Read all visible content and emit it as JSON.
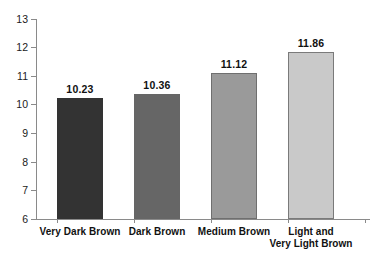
{
  "chart_data": {
    "type": "bar",
    "title": "",
    "xlabel": "",
    "ylabel": "",
    "ylim": [
      6,
      13
    ],
    "ytick_labels": [
      "13",
      "12",
      "11",
      "10",
      "9",
      "8",
      "7",
      "6"
    ],
    "yticks": [
      13,
      12,
      11,
      10,
      9,
      8,
      7,
      6
    ],
    "grid": false,
    "legend": null,
    "categories": [
      "Very Dark Brown",
      "Dark Brown",
      "Medium Brown",
      "Light and Very Light Brown"
    ],
    "category_label_lines": [
      [
        "Very Dark Brown"
      ],
      [
        "Dark Brown"
      ],
      [
        "Medium Brown"
      ],
      [
        "Light and",
        "Very Light Brown"
      ]
    ],
    "values": [
      10.23,
      10.36,
      11.12,
      11.86
    ],
    "value_labels": [
      "10.23",
      "10.36",
      "11.12",
      "11.86"
    ],
    "bar_colors": [
      "#333333",
      "#666666",
      "#9a9a9a",
      "#c9c9c9"
    ],
    "bar_border_colors": [
      "#333333",
      "#666666",
      "#6f6f6f",
      "#7a7a7a"
    ],
    "axis_color": "#8a8a8a",
    "background_color": "#ffffff"
  }
}
